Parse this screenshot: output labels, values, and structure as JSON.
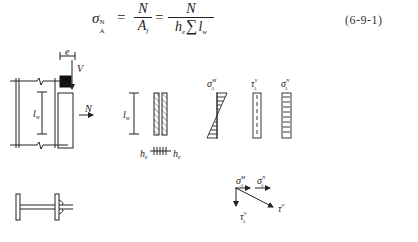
{
  "equation": {
    "lhs_symbol": "σ",
    "lhs_sup": "N",
    "lhs_sub": "A",
    "equals": "=",
    "frac1": {
      "numerator": "N",
      "denominator_main": "A",
      "denominator_sub": "f"
    },
    "frac2": {
      "numerator": "N",
      "denominator_h": "h",
      "denominator_h_sub": "e",
      "denominator_sum": "∑",
      "denominator_l": "l",
      "denominator_l_sub": "w"
    },
    "number": "(6-9-1)"
  },
  "figure": {
    "left_elevation": {
      "label_e": "e",
      "label_V": "V",
      "label_N": "N",
      "label_lw": "l",
      "label_lw_sub": "w"
    },
    "weld_section": {
      "label_lw": "l",
      "label_lw_sub": "w",
      "label_he_left": "h",
      "label_he_right": "h",
      "label_he_sub": "e"
    },
    "stress_diagrams": [
      {
        "symbol": "σ",
        "sup": "M",
        "sub": "A"
      },
      {
        "symbol": "τ",
        "sup": "V",
        "sub": "A"
      },
      {
        "symbol": "σ",
        "sup": "N",
        "sub": "A"
      }
    ],
    "vector_diagram": {
      "sigma_M": {
        "symbol": "σ",
        "sup": "M",
        "sub": "A"
      },
      "sigma_N": {
        "symbol": "σ",
        "sup": "N",
        "sub": "A"
      },
      "tau_A": {
        "symbol": "τ",
        "sup": "V",
        "sub": "A"
      },
      "tau_V": {
        "symbol": "τ",
        "sup": "V"
      }
    }
  }
}
